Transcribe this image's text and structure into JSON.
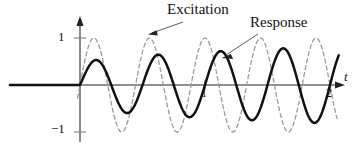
{
  "figure": {
    "title": "",
    "background_color": "#ffffff",
    "axis_color": "#6b6b6b",
    "response_color": "#111111",
    "excitation_color": "#9a9a9a"
  },
  "labels": {
    "excitation": "Excitation",
    "response": "Response",
    "y_tick_pos": "1",
    "y_tick_neg": "−1",
    "x_tick_1": "1",
    "x_tick_2": "2",
    "x_axis_label": "t"
  },
  "chart_data": {
    "type": "line",
    "title": "",
    "xlabel": "t",
    "ylabel": "",
    "xlim": [
      -0.55,
      2.2
    ],
    "ylim": [
      -1.35,
      1.35
    ],
    "grid": false,
    "legend": "annotations",
    "x_ticks": [
      1,
      2
    ],
    "y_ticks": [
      -1,
      1
    ],
    "annotations": [
      {
        "text": "Excitation",
        "target_x": 0.56,
        "target_y": 0.92,
        "arrow_from_x": 0.82,
        "arrow_from_y": 1.28
      },
      {
        "text": "Response",
        "target_x": 1.14,
        "target_y": 0.66,
        "arrow_from_x": 1.44,
        "arrow_from_y": 1.02
      }
    ],
    "series": [
      {
        "name": "Excitation",
        "style": "dashed",
        "color": "#9a9a9a",
        "description": "Constant-amplitude forcing sine, amplitude 1, 4.5 cycles over t = 0..2",
        "formula": "y = sin(9*pi*t/2)",
        "amplitude": 1,
        "cycles_over_domain": 4.5,
        "x": [
          0.0,
          0.11,
          0.22,
          0.33,
          0.44,
          0.56,
          0.67,
          0.78,
          0.89,
          1.0,
          1.11,
          1.22,
          1.33,
          1.44,
          1.56,
          1.67,
          1.78,
          1.89,
          2.0
        ],
        "y": [
          0.0,
          1.0,
          0.0,
          -1.0,
          0.0,
          1.0,
          0.0,
          -1.0,
          0.0,
          1.0,
          0.0,
          -1.0,
          0.0,
          1.0,
          0.0,
          -1.0,
          0.0,
          1.0,
          0.0
        ]
      },
      {
        "name": "Response",
        "style": "solid",
        "color": "#111111",
        "description": "Beating / resonant response, amplitude grows from 0.45 to about 0.82 across the window",
        "formula": "y = A(t)*sin(4*pi*t), A grows 0.45 -> 0.82",
        "amplitude_start": 0.45,
        "amplitude_end": 0.82,
        "cycles_over_domain": 4.0,
        "x": [
          0.0,
          0.125,
          0.25,
          0.375,
          0.5,
          0.625,
          0.75,
          0.875,
          1.0,
          1.125,
          1.25,
          1.375,
          1.5,
          1.625,
          1.75,
          1.875,
          2.0
        ],
        "y": [
          0.0,
          0.45,
          0.0,
          -0.58,
          0.0,
          0.68,
          0.0,
          -0.72,
          0.0,
          0.76,
          0.0,
          -0.78,
          0.0,
          0.8,
          0.0,
          -0.82,
          0.0
        ]
      }
    ]
  }
}
